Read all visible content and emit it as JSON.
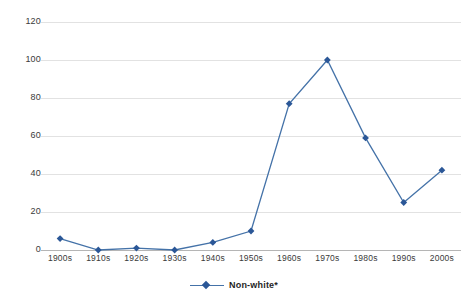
{
  "chart_data": {
    "type": "line",
    "title": "",
    "xlabel": "",
    "ylabel": "",
    "categories": [
      "1900s",
      "1910s",
      "1920s",
      "1930s",
      "1940s",
      "1950s",
      "1960s",
      "1970s",
      "1980s",
      "1990s",
      "2000s"
    ],
    "series": [
      {
        "name": "Non-white*",
        "values": [
          6,
          0,
          1,
          0,
          4,
          10,
          77,
          100,
          59,
          25,
          42
        ],
        "color": "#2b5797",
        "line_color": "#4472a8",
        "marker": "diamond"
      }
    ],
    "ylim": [
      0,
      120
    ],
    "yticks": [
      0,
      20,
      40,
      60,
      80,
      100,
      120
    ],
    "ytick_labels": [
      "0",
      "20",
      "40",
      "60",
      "80",
      "100",
      "120"
    ],
    "grid": true,
    "grid_color": "#e2e2e2",
    "axis_color": "#b5b5b5",
    "legend_position": "bottom",
    "background": "#ffffff"
  },
  "legend": {
    "entries": [
      {
        "label": "Non-white*"
      }
    ]
  }
}
